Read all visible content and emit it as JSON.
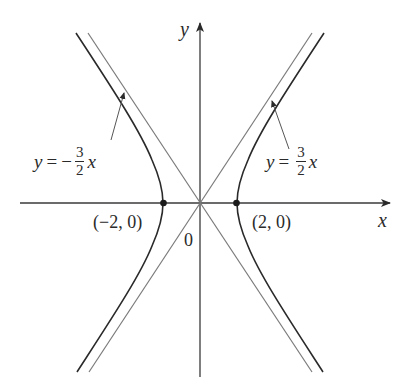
{
  "figure": {
    "type": "hyperbola",
    "equation_hint": "x^2/4 - y^2/9 = 1",
    "colors": {
      "curve": "#2a2a2a",
      "asymptote": "#7a7a7a",
      "axis": "#3a3a3a",
      "text": "#2a2a2a"
    },
    "axes": {
      "x_label": "x",
      "y_label": "y",
      "origin_label": "0"
    },
    "vertices": [
      {
        "label": "(−2, 0)",
        "x": -2,
        "y": 0
      },
      {
        "label": "(2, 0)",
        "x": 2,
        "y": 0
      }
    ],
    "asymptotes": [
      {
        "lhs": "y",
        "eq": "=",
        "sign": "−",
        "num": "3",
        "den": "2",
        "var": "x",
        "slope": -1.5
      },
      {
        "lhs": "y",
        "eq": "=",
        "sign": "",
        "num": "3",
        "den": "2",
        "var": "x",
        "slope": 1.5
      }
    ]
  }
}
